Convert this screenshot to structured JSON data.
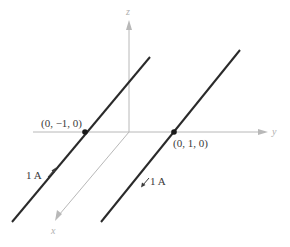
{
  "diagram": {
    "axes": {
      "x": {
        "label": "x",
        "color": "#b8b8b8"
      },
      "y": {
        "label": "y",
        "color": "#b8b8b8"
      },
      "z": {
        "label": "z",
        "color": "#b8b8b8"
      }
    },
    "wires": [
      {
        "id": "wire-left",
        "passes_through": "(0, −1, 0)",
        "current": "1 A",
        "current_direction": "toward -x (up-right in view)",
        "color": "#2a2a2a"
      },
      {
        "id": "wire-right",
        "passes_through": "(0, 1, 0)",
        "current": "1 A",
        "current_direction": "toward +x (down-left in view)",
        "color": "#2a2a2a"
      }
    ],
    "labels": {
      "point_left": "(0, −1, 0)",
      "point_right": "(0, 1, 0)",
      "current_left": "1 A",
      "current_right": "1 A"
    }
  }
}
